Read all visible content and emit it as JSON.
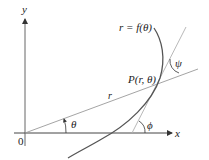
{
  "diagram": {
    "labels": {
      "y_axis": "y",
      "x_axis": "x",
      "origin": "0",
      "curve": "r = f(θ)",
      "point": "P(r, θ)",
      "radius": "r",
      "theta": "θ",
      "phi": "ϕ",
      "psi": "ψ"
    },
    "colors": {
      "axis": "#333333",
      "curve": "#444444",
      "thin_line": "#9a9a9a"
    }
  }
}
